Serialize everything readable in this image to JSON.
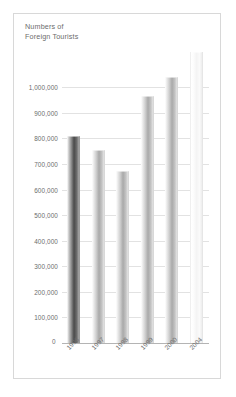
{
  "chart_data": {
    "type": "bar",
    "title": "Numbers of\nForeign Tourists",
    "xlabel": "",
    "ylabel": "",
    "categories": [
      "1996",
      "1997",
      "1998",
      "1999",
      "2000",
      "2004"
    ],
    "values": [
      810000,
      755000,
      672000,
      965000,
      1040000,
      1140000
    ],
    "ylim": [
      0,
      1150000
    ],
    "ytick_labels": [
      "1,000,000",
      "900,000",
      "800,000",
      "700,000",
      "600,000",
      "500,000",
      "400,000",
      "300,000",
      "200,000",
      "100,000",
      "0"
    ],
    "ytick_values": [
      1000000,
      900000,
      800000,
      700000,
      600000,
      500000,
      400000,
      300000,
      200000,
      100000,
      0
    ],
    "grid": true,
    "legend": "none",
    "bar_styles": [
      "dark",
      "mid",
      "mid",
      "mid",
      "mid",
      "pale"
    ]
  },
  "colors": {
    "frame_border": "#d8d8d8",
    "gridline": "#e2e2e2",
    "axis": "#b4b4b4",
    "text": "#6c6c6c",
    "bar_dark": "#4a4a4a",
    "bar_mid": "#a9a9a9",
    "bar_pale": "#f7f7f7",
    "background": "#ffffff"
  }
}
